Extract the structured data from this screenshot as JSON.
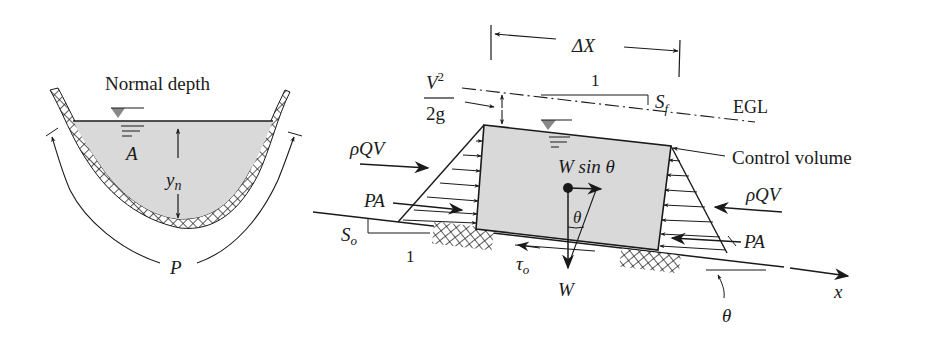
{
  "left_figure": {
    "title": "Normal depth",
    "area_label": "A",
    "depth_label": "y",
    "depth_subscript": "n",
    "perimeter_label": "P",
    "colors": {
      "water": "#d9d9d9",
      "line": "#1a1a1a"
    }
  },
  "right_figure": {
    "delta_x_label": "ΔX",
    "egl_label": "EGL",
    "velocity_head_num": "V",
    "velocity_head_exp": "2",
    "velocity_head_den": "2g",
    "friction_slope_run": "1",
    "friction_slope_label": "S",
    "friction_slope_sub": "f",
    "bed_slope_label": "S",
    "bed_slope_sub": "o",
    "bed_slope_run": "1",
    "control_volume_label": "Control volume",
    "momentum_in_label": "ρQV",
    "momentum_out_label": "ρQV",
    "pressure_in_label": "PA",
    "pressure_out_label": "PA",
    "weight_component_label": "W sin θ",
    "weight_label": "W",
    "theta_label": "θ",
    "theta_bottom_label": "θ",
    "shear_label": "τ",
    "shear_sub": "o",
    "x_axis_label": "x",
    "colors": {
      "control_volume": "#d9d9d9",
      "line": "#1a1a1a"
    }
  }
}
